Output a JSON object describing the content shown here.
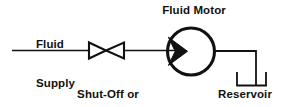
{
  "diagram": {
    "background_color": "#ffffff",
    "line_color": "#111111",
    "labels": {
      "fluid_supply_line1": "Fluid",
      "fluid_supply_line2": "Supply",
      "valve_line1": "Shut-Off or",
      "valve_line2": "Needle Valve",
      "fluid_motor": "Fluid Motor",
      "reservoir": "Reservoir"
    },
    "components": [
      {
        "name": "supply-line",
        "type": "pipe",
        "description": "Horizontal fluid supply line entering from the left"
      },
      {
        "name": "shut-off-needle-valve",
        "type": "valve",
        "symbol": "bowtie",
        "description": "Two opposed hollow triangles forming a bowtie valve symbol"
      },
      {
        "name": "fluid-motor",
        "type": "motor",
        "symbol": "circle-with-inward-arrow",
        "description": "Circle with a solid triangular arrow pointing inward from the inlet"
      },
      {
        "name": "return-line",
        "type": "pipe",
        "description": "Line from motor outlet running right then down into reservoir"
      },
      {
        "name": "reservoir",
        "type": "tank",
        "symbol": "open-top-u",
        "description": "Open-top U shaped reservoir tank"
      }
    ]
  }
}
